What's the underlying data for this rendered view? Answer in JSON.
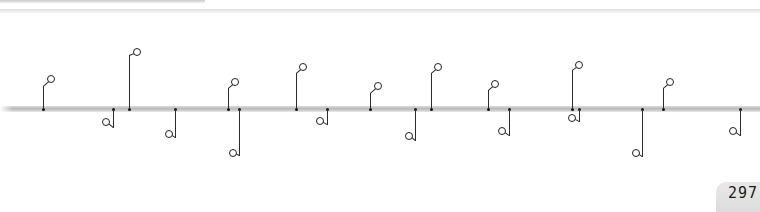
{
  "page": {
    "number": "297"
  },
  "timeline": {
    "events": [
      {
        "id": "feb14",
        "side": "up",
        "axis_x": 43,
        "date": "14 February",
        "parts": [
          [
            "t",
            "Seven"
          ],
          [
            "n",
            ""
          ],
          [
            "t",
            "killed in "
          ],
          [
            "b",
            "St Valentine's Day"
          ],
          [
            "n",
            ""
          ],
          [
            "b",
            "Massacre"
          ],
          [
            "t",
            " – the result of"
          ],
          [
            "n",
            ""
          ],
          [
            "t",
            "gang warfare in Chicago"
          ]
        ]
      },
      {
        "id": "mar4",
        "side": "down",
        "axis_x": 113,
        "date": "4 March",
        "parts": [
          [
            "t",
            "Herbert "
          ],
          [
            "b",
            "Hoover"
          ],
          [
            "n",
            ""
          ],
          [
            "b",
            "inaugurated"
          ],
          [
            "t",
            " as US President"
          ]
        ]
      },
      {
        "id": "apr8",
        "side": "up",
        "axis_x": 129,
        "date": "8 April",
        "parts": [
          [
            "t",
            "Indian"
          ],
          [
            "n",
            ""
          ],
          [
            "t",
            "revolutionaries"
          ],
          [
            "n",
            ""
          ],
          [
            "t",
            "explode bomb in"
          ],
          [
            "n",
            ""
          ],
          [
            "t",
            "corridors of "
          ],
          [
            "b",
            "Legislative"
          ],
          [
            "n",
            ""
          ],
          [
            "b",
            "Assembly in Delhi"
          ]
        ]
      },
      {
        "id": "may16",
        "side": "down",
        "axis_x": 175,
        "date": "16 May",
        "parts": [
          [
            "t",
            "First Academy"
          ],
          [
            "n",
            ""
          ],
          [
            "t",
            "Awards (\""
          ],
          [
            "b",
            "Oscars"
          ],
          [
            "t",
            "\")"
          ],
          [
            "n",
            ""
          ],
          [
            "t",
            "ceremony takes place"
          ]
        ]
      },
      {
        "id": "jun8",
        "side": "up",
        "axis_x": 228,
        "date": "8 June",
        "parts": [
          [
            "t",
            "Labour"
          ],
          [
            "n",
            ""
          ],
          [
            "t",
            "government takes"
          ],
          [
            "n",
            ""
          ],
          [
            "t",
            "power in Britain under"
          ],
          [
            "n",
            ""
          ],
          [
            "b",
            "Ramsay Macdonald"
          ]
        ]
      },
      {
        "id": "jun21",
        "side": "down",
        "axis_x": 239,
        "date": "21 June",
        "parts": [
          [
            "t",
            "US-brokered"
          ],
          [
            "n",
            ""
          ],
          [
            "t",
            "truce ends "
          ],
          [
            "b",
            "Cristero"
          ],
          [
            "n",
            ""
          ],
          [
            "b",
            "War"
          ],
          [
            "t",
            " in Mexico"
          ]
        ]
      },
      {
        "id": "aug8",
        "side": "up",
        "axis_x": 296,
        "date": "8–29 August",
        "parts": [
          [
            "t",
            "German"
          ],
          [
            "n",
            ""
          ],
          [
            "t",
            "airship "
          ],
          [
            "i",
            "Graf Zeppelin"
          ],
          [
            "n",
            ""
          ],
          [
            "b",
            "flies around world"
          ]
        ]
      },
      {
        "id": "aug16",
        "side": "down",
        "axis_x": 327,
        "date": "16 August",
        "parts": [
          [
            "b",
            "Riots"
          ],
          [
            "t",
            " break"
          ],
          [
            "n",
            ""
          ],
          [
            "t",
            "out "
          ],
          [
            "b",
            "in Palestine"
          ],
          [
            "t",
            " setting"
          ],
          [
            "n",
            ""
          ],
          [
            "t",
            "Arabs against Jews"
          ]
        ]
      },
      {
        "id": "aug31",
        "side": "up",
        "axis_x": 370,
        "date": "31 August",
        "parts": [
          [
            "b",
            "Young Plan"
          ],
          [
            "n",
            ""
          ],
          [
            "t",
            "for German payment of"
          ],
          [
            "n",
            ""
          ],
          [
            "t",
            "reparations finalized"
          ]
        ]
      },
      {
        "id": "sep5",
        "side": "down",
        "axis_x": 415,
        "date": "5 September",
        "parts": [
          [
            "t",
            "French"
          ],
          [
            "n",
            ""
          ],
          [
            "t",
            "Prime Minister Aristide"
          ],
          [
            "n",
            ""
          ],
          [
            "t",
            "Briand proposes a "
          ],
          [
            "b",
            "United"
          ],
          [
            "n",
            ""
          ],
          [
            "b",
            "States of Europe"
          ]
        ]
      },
      {
        "id": "sep24",
        "side": "up",
        "axis_x": 431,
        "date": "24 September",
        "parts": [
          [
            "t",
            "US Army"
          ],
          [
            "n",
            ""
          ],
          [
            "t",
            "pilot James Doolittle makes"
          ],
          [
            "n",
            ""
          ],
          [
            "b",
            "first \"blind flight\""
          ],
          [
            "t",
            " using"
          ],
          [
            "n",
            ""
          ],
          [
            "t",
            "instruments only"
          ]
        ]
      },
      {
        "id": "oct3",
        "side": "down",
        "axis_x": 509,
        "date": "3 October",
        "parts": [
          [
            "b",
            "Gustav Stresemann,"
          ],
          [
            "n",
            ""
          ],
          [
            "t",
            "architect of Germany's"
          ],
          [
            "n",
            ""
          ],
          [
            "t",
            "improved relations with"
          ],
          [
            "n",
            ""
          ],
          [
            "t",
            "France, "
          ],
          [
            "b",
            "dies"
          ],
          [
            "t",
            " (b. 1878)"
          ]
        ]
      },
      {
        "id": "sep28",
        "side": "up",
        "axis_x": 488,
        "date": "28 September",
        "parts": [
          [
            "t",
            "In "
          ],
          [
            "b",
            "India,"
          ],
          [
            "n",
            ""
          ],
          [
            "b",
            "marriage"
          ],
          [
            "t",
            " of girls under 14"
          ],
          [
            "n",
            ""
          ],
          [
            "t",
            "banned by "
          ],
          [
            "b",
            "Sarda Act"
          ]
        ]
      },
      {
        "id": "oct31",
        "side": "down",
        "axis_x": 579,
        "date": "31 October",
        "parts": [
          [
            "b",
            "Lord Irwin"
          ],
          [
            "t",
            ", British"
          ],
          [
            "n",
            ""
          ],
          [
            "t",
            "viceroy of India, declares that"
          ],
          [
            "n",
            ""
          ],
          [
            "t",
            "India will eventually receive"
          ],
          [
            "n",
            ""
          ],
          [
            "t",
            "dominion status"
          ]
        ]
      },
      {
        "id": "oct24",
        "side": "up",
        "axis_x": 572,
        "date": "24–29 October",
        "parts": [
          [
            "t",
            "Share"
          ],
          [
            "n",
            ""
          ],
          [
            "t",
            "prices fall dramatically"
          ],
          [
            "n",
            ""
          ],
          [
            "t",
            "in "
          ],
          [
            "b",
            "Wall Street crash"
          ]
        ]
      },
      {
        "id": "nov7",
        "side": "down",
        "axis_x": 642,
        "date": "7 November",
        "parts": [
          [
            "b",
            "Museum"
          ],
          [
            "n",
            ""
          ],
          [
            "b",
            "of Modern Art"
          ],
          [
            "t",
            " opens"
          ],
          [
            "n",
            ""
          ],
          [
            "t",
            "in Manhattan"
          ]
        ]
      },
      {
        "id": "nov17",
        "side": "up",
        "axis_x": 663,
        "date": "17 November",
        "parts": [
          [
            "n",
            ""
          ],
          [
            "t",
            "Nikolai "
          ],
          [
            "b",
            "Bukharin,"
          ],
          [
            "n",
            ""
          ],
          [
            "t",
            "Stalin's last opponent"
          ],
          [
            "n",
            ""
          ],
          [
            "t",
            "in Soviet government,"
          ],
          [
            "n",
            ""
          ],
          [
            "b",
            "expelled from Politburo"
          ]
        ]
      },
      {
        "id": "dec29",
        "side": "down",
        "axis_x": 740,
        "date": "29 December",
        "parts": [
          [
            "t",
            "All-India"
          ],
          [
            "n",
            ""
          ],
          [
            "t",
            "Congress "
          ],
          [
            "b",
            "demands"
          ],
          [
            "n",
            ""
          ],
          [
            "b",
            "immediate independence"
          ],
          [
            "n",
            ""
          ],
          [
            "t",
            "from Britain"
          ]
        ]
      }
    ]
  },
  "labels": {
    "feb14": "14 February Seven killed in St Valentine's Day Massacre – the result of gang warfare in Chicago",
    "mar4": "4 March Herbert Hoover inaugurated as US President",
    "apr8": "8 April Indian revolutionaries explode bomb in corridors of Legislative Assembly in Delhi",
    "may16": "16 May First Academy Awards (\"Oscars\") ceremony takes place",
    "jun8": "8 June Labour government takes power in Britain under Ramsay Macdonald",
    "jun21": "21 June US-brokered truce ends Cristero War in Mexico",
    "aug8": "8–29 August German airship Graf Zeppelin flies around world",
    "aug16": "16 August Riots break out in Palestine setting Arabs against Jews",
    "aug31": "31 August Young Plan for German payment of reparations finalized",
    "sep5": "5 September French Prime Minister Aristide Briand proposes a United States of Europe",
    "sep24": "24 September US Army pilot James Doolittle makes first \"blind flight\" using instruments only",
    "oct3": "3 October Gustav Stresemann, architect of Germany's improved relations with France, dies (b. 1878)",
    "sep28": "28 September In India, marriage of girls under 14 banned by Sarda Act",
    "oct31": "31 October Lord Irwin, British viceroy of India, declares that India will eventually receive dominion status",
    "oct24": "24–29 October Share prices fall dramatically in Wall Street crash",
    "nov7": "7 November Museum of Modern Art opens in Manhattan",
    "nov17": "17 November Nikolai Bukharin, Stalin's last opponent in Soviet government, expelled from Politburo",
    "dec29": "29 December All-India Congress demands immediate independence from Britain"
  },
  "geometry": {
    "up": {
      "feb14": [
        43,
        86,
        51,
        79
      ],
      "apr8": [
        129,
        55,
        137,
        52
      ],
      "jun8": [
        228,
        88,
        235,
        82
      ],
      "aug8": [
        296,
        73,
        303,
        67
      ],
      "aug31": [
        370,
        93,
        378,
        86
      ],
      "sep24": [
        431,
        73,
        438,
        67
      ],
      "sep28": [
        488,
        90,
        495,
        84
      ],
      "oct24": [
        572,
        70,
        579,
        65
      ],
      "nov17": [
        663,
        88,
        670,
        82
      ]
    },
    "down": {
      "mar4": [
        113,
        128,
        106,
        122
      ],
      "may16": [
        175,
        138,
        169,
        134
      ],
      "jun21": [
        239,
        156,
        233,
        153
      ],
      "aug16": [
        327,
        125,
        320,
        121
      ],
      "sep5": [
        415,
        141,
        409,
        136
      ],
      "oct3": [
        509,
        136,
        502,
        131
      ],
      "oct31": [
        579,
        122,
        572,
        118
      ],
      "nov7": [
        642,
        157,
        636,
        153
      ],
      "dec29": [
        740,
        136,
        733,
        131
      ]
    }
  }
}
